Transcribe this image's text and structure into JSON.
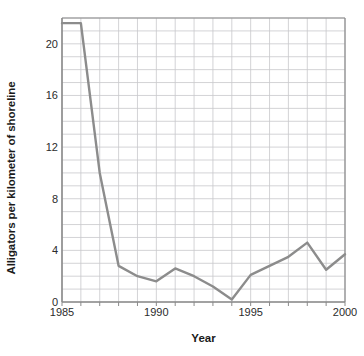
{
  "chart_data": {
    "type": "line",
    "title": "",
    "xlabel": "Year",
    "ylabel": "Alligators per kilometer of shoreline",
    "x": [
      1985,
      1986,
      1987,
      1988,
      1989,
      1990,
      1991,
      1992,
      1993,
      1994,
      1995,
      1996,
      1997,
      1998,
      1999,
      2000
    ],
    "values": [
      21.6,
      21.6,
      10.0,
      2.8,
      2.0,
      1.6,
      2.6,
      2.0,
      1.2,
      0.2,
      2.1,
      2.8,
      3.5,
      4.6,
      2.5,
      3.7
    ],
    "series": [
      {
        "name": "Alligators per kilometer of shoreline",
        "values": [
          21.6,
          21.6,
          10.0,
          2.8,
          2.0,
          1.6,
          2.6,
          2.0,
          1.2,
          0.2,
          2.1,
          2.8,
          3.5,
          4.6,
          2.5,
          3.7
        ]
      }
    ],
    "xlim": [
      1985,
      2000
    ],
    "ylim": [
      0,
      22
    ],
    "xticks": [
      1985,
      1990,
      1995,
      2000
    ],
    "xtick_labels": [
      "1985",
      "1990",
      "1995",
      "2000"
    ],
    "yticks": [
      0,
      4,
      8,
      12,
      16,
      20
    ],
    "ytick_labels": [
      "0",
      "4",
      "8",
      "12",
      "16",
      "20"
    ],
    "grid": true,
    "grid_x_step": 1,
    "grid_y_step": 1,
    "legend": "none",
    "line_color": "#8c8c8c",
    "grid_color": "#c8c8cc",
    "axis_color": "#8a8a8a",
    "background_color": "#ffffff"
  }
}
